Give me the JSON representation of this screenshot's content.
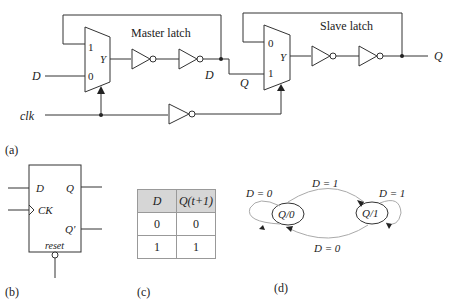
{
  "panel_a": {
    "label": "(a)",
    "master_title": "Master latch",
    "slave_title": "Slave latch",
    "input_d": "D",
    "input_clk": "clk",
    "master_mux": {
      "in1": "1",
      "in0": "0",
      "out": "Y"
    },
    "slave_mux": {
      "in0": "0",
      "in1": "1",
      "out": "Y"
    },
    "mid_d": "D",
    "mid_q": "Q",
    "output_q": "Q"
  },
  "panel_b": {
    "label": "(b)",
    "pin_d": "D",
    "pin_ck": "CK",
    "pin_q": "Q",
    "pin_qn": "Q'",
    "pin_reset": "reset"
  },
  "panel_c": {
    "label": "(c)",
    "headers": [
      "D",
      "Q(t+1)"
    ],
    "rows": [
      [
        "0",
        "0"
      ],
      [
        "1",
        "1"
      ]
    ]
  },
  "panel_d": {
    "label": "(d)",
    "states": [
      "Q/0",
      "Q/1"
    ],
    "transitions": {
      "self0": "D = 0",
      "to1": "D = 1",
      "self1": "D = 1",
      "to0": "D = 0"
    }
  }
}
